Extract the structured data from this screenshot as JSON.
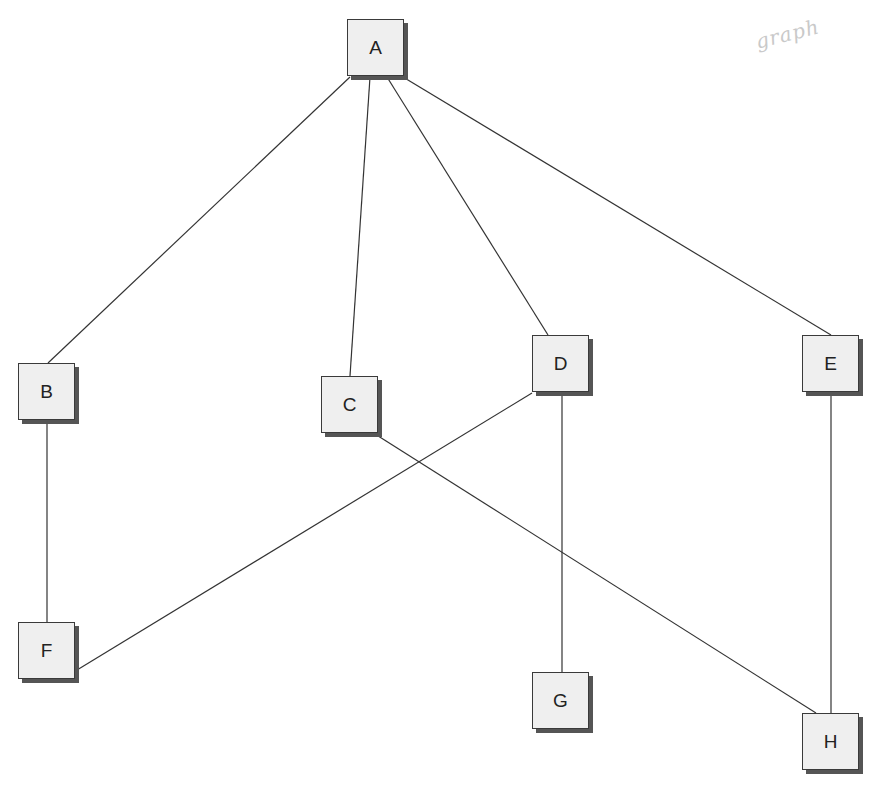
{
  "diagram": {
    "type": "undirected-graph",
    "annotation": "graph",
    "colors": {
      "node_fill": "#efefef",
      "node_border": "#3a3a3a",
      "node_shadow": "#555555",
      "edge": "#333333",
      "annotation": "#c9c9c9"
    },
    "nodes": [
      {
        "id": "A",
        "label": "A"
      },
      {
        "id": "B",
        "label": "B"
      },
      {
        "id": "C",
        "label": "C"
      },
      {
        "id": "D",
        "label": "D"
      },
      {
        "id": "E",
        "label": "E"
      },
      {
        "id": "F",
        "label": "F"
      },
      {
        "id": "G",
        "label": "G"
      },
      {
        "id": "H",
        "label": "H"
      }
    ],
    "edges": [
      {
        "from": "A",
        "to": "B"
      },
      {
        "from": "A",
        "to": "C"
      },
      {
        "from": "A",
        "to": "D"
      },
      {
        "from": "A",
        "to": "E"
      },
      {
        "from": "B",
        "to": "F"
      },
      {
        "from": "D",
        "to": "F"
      },
      {
        "from": "D",
        "to": "G"
      },
      {
        "from": "C",
        "to": "H"
      },
      {
        "from": "E",
        "to": "H"
      }
    ]
  }
}
